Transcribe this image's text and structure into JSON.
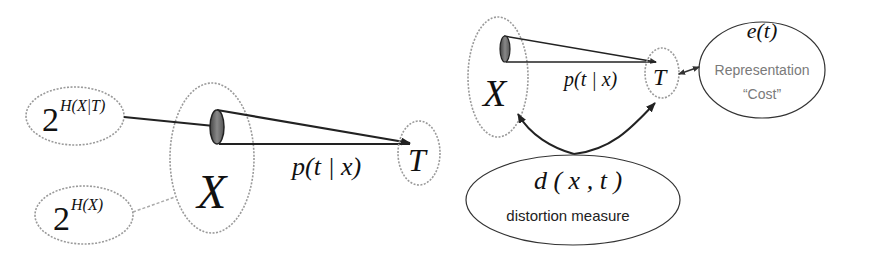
{
  "left_diagram": {
    "source_set": {
      "label": "X"
    },
    "target_set": {
      "label": "T"
    },
    "mapping": {
      "label": "p(t | x)"
    },
    "conditional_volume": {
      "base": "2",
      "exponent": "H(X|T)"
    },
    "total_volume": {
      "base": "2",
      "exponent": "H(X)"
    }
  },
  "right_diagram": {
    "source_set": {
      "label": "X"
    },
    "target_set": {
      "label": "T"
    },
    "mapping": {
      "label": "p(t | x)"
    },
    "cost_node": {
      "formula": "e(t)",
      "line1": "Representation",
      "line2": "“Cost”"
    },
    "distortion_node": {
      "formula": "d ( x , t )",
      "caption": "distortion measure"
    }
  },
  "colors": {
    "ink": "#111111",
    "dotted_outline": "#9a9a9a",
    "cone_fill": "#666666",
    "caption_gray": "#777777"
  }
}
